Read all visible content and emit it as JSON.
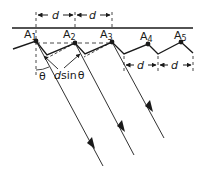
{
  "diagram": {
    "points": [
      {
        "label": "A",
        "sub": "1"
      },
      {
        "label": "A",
        "sub": "2"
      },
      {
        "label": "A",
        "sub": "3"
      },
      {
        "label": "A",
        "sub": "4"
      },
      {
        "label": "A",
        "sub": "5"
      }
    ],
    "spacing_label": "d",
    "angle_label": "θ",
    "path_difference_label": "dsinθ",
    "path_difference_parts": {
      "d": "d",
      "sin": "sin",
      "theta": "θ"
    },
    "colors": {
      "ink": "#1a1a1a",
      "background": "#ffffff"
    }
  }
}
